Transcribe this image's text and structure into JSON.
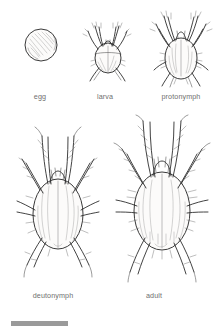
{
  "figure": {
    "background_color": "#ffffff",
    "ink_color": "#2e2e2e",
    "label_color": "#6f6f6f",
    "scale_bar": {
      "name": "scale-bar",
      "color": "#9a9a9a",
      "x": 11,
      "y": 321,
      "width": 57,
      "height": 5,
      "label": ""
    },
    "rows": [
      {
        "name": "top-row",
        "stages": [
          {
            "key": "egg",
            "label": "egg",
            "icon": "egg-sphere-icon",
            "label_x": 22,
            "label_y": 92,
            "label_width": 36,
            "legs": 0,
            "description": "spherical egg with cross-hatched shading"
          },
          {
            "key": "larva",
            "label": "larva",
            "icon": "larva-mite-icon",
            "label_x": 85,
            "label_y": 92,
            "label_width": 40,
            "legs": 6,
            "description": "six-legged larva, small oval body"
          },
          {
            "key": "protonymph",
            "label": "protonymph",
            "icon": "protonymph-mite-icon",
            "label_x": 150,
            "label_y": 92,
            "label_width": 62,
            "legs": 8,
            "description": "eight-legged protonymph, teardrop body"
          }
        ]
      },
      {
        "name": "bottom-row",
        "stages": [
          {
            "key": "deutonymph",
            "label": "deutonymph",
            "icon": "deutonymph-mite-icon",
            "label_x": 18,
            "label_y": 291,
            "label_width": 70,
            "legs": 8,
            "description": "eight-legged deutonymph, large oval body"
          },
          {
            "key": "adult",
            "label": "adult",
            "icon": "adult-mite-icon",
            "label_x": 130,
            "label_y": 291,
            "label_width": 48,
            "legs": 8,
            "description": "eight-legged adult mite, largest body with bristles"
          }
        ]
      }
    ]
  }
}
